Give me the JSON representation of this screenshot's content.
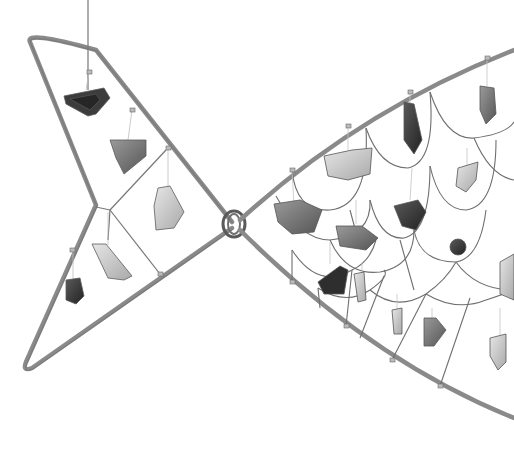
{
  "image": {
    "subject": "Wire fish sculpture with hanging glass and stone fragments",
    "style": "grayscale photograph on white background",
    "colors": {
      "background": "#ffffff",
      "frame_wire": "#8a8a8a",
      "frame_wire_shadow": "#6a6a6a",
      "thin_wire": "#777777",
      "dark_piece": "#3a3a3a",
      "mid_piece": "#7d7d7d",
      "light_piece": "#c8c8c8"
    },
    "parts": [
      "tail-frame",
      "body-frame",
      "knot-joint",
      "scale-mesh",
      "hanging-fragments"
    ]
  }
}
